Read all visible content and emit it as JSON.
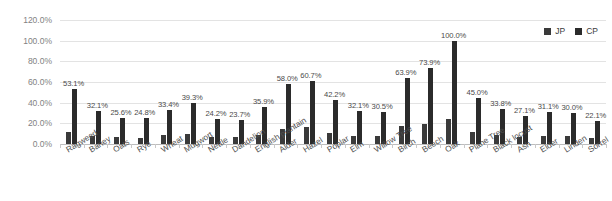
{
  "chart_data": {
    "type": "bar",
    "title": "",
    "xlabel": "",
    "ylabel": "",
    "ylim": [
      0,
      120
    ],
    "grid": true,
    "legend_position": "top-right",
    "ytick_labels": [
      "120.0%",
      "100.0%",
      "80.0%",
      "60.0%",
      "40.0%",
      "20.0%",
      "0.0%"
    ],
    "ytick_values": [
      120,
      100,
      80,
      60,
      40,
      20,
      0
    ],
    "categories": [
      "Ragweed",
      "Barley",
      "Oats",
      "Rye",
      "Wheat",
      "Mugwort",
      "Nettle",
      "Dandelion",
      "English plantain",
      "Alder",
      "Hazel",
      "Poplar",
      "Elm",
      "Willow Tree",
      "Birch",
      "Beech",
      "Oak",
      "Plane Tree",
      "Black locust",
      "Ash",
      "Elder",
      "Linden",
      "Sorrel"
    ],
    "series": [
      {
        "name": "JP",
        "color": "#3a3a3a",
        "values": [
          12.0,
          8.0,
          6.5,
          6.0,
          9.0,
          10.0,
          7.0,
          6.5,
          9.0,
          15.0,
          16.0,
          11.0,
          8.0,
          8.0,
          17.0,
          19.0,
          24.0,
          12.0,
          9.0,
          7.0,
          8.0,
          8.0,
          6.0
        ]
      },
      {
        "name": "CP",
        "color": "#2b2b2b",
        "values": [
          53.1,
          32.1,
          25.6,
          24.8,
          33.4,
          39.3,
          24.2,
          23.7,
          35.9,
          58.0,
          60.7,
          42.2,
          32.1,
          30.5,
          63.9,
          73.9,
          100.0,
          45.0,
          33.8,
          27.1,
          31.1,
          30.0,
          22.1
        ]
      }
    ],
    "value_labels": [
      "53.1%",
      "32.1%",
      "25.6%",
      "24.8%",
      "33.4%",
      "39.3%",
      "24.2%",
      "23.7%",
      "35.9%",
      "58.0%",
      "60.7%",
      "42.2%",
      "32.1%",
      "30.5%",
      "63.9%",
      "73.9%",
      "100.0%",
      "45.0%",
      "33.8%",
      "27.1%",
      "31.1%",
      "30.0%",
      "22.1%"
    ]
  },
  "legend": {
    "entries": [
      {
        "label": "JP"
      },
      {
        "label": "CP"
      }
    ]
  }
}
